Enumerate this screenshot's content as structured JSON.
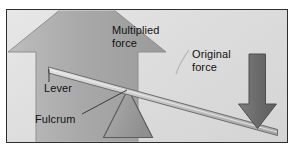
{
  "diagram": {
    "background_color": "#dedede",
    "border_color": "#2e2e2e",
    "labels": {
      "multiplied_force": "Multiplied\nforce",
      "original_force": "Original\nforce",
      "lever": "Lever",
      "fulcrum": "Fulcrum"
    },
    "shapes": {
      "up_arrow": {
        "name": "multiplied-force-arrow",
        "direction": "up",
        "fill": "#a8a8a8",
        "stroke": "#8e8e8e"
      },
      "down_arrow": {
        "name": "original-force-arrow",
        "direction": "down",
        "fill": "#6e6e6e",
        "stroke": "#4f4f4f"
      },
      "fulcrum_triangle": {
        "name": "fulcrum-triangle",
        "fill": "#9d9d9d",
        "stroke": "#5a5a5a"
      },
      "lever_bar": {
        "name": "lever-bar",
        "fill": "#c9c9c9",
        "stroke": "#6a6a6a"
      }
    },
    "leader_lines": {
      "lever": "vertical line from lever left end down to Lever label",
      "fulcrum": "diagonal line from Fulcrum label up-right to triangle apex",
      "original_force": "short curve from Original force label down-left"
    }
  }
}
